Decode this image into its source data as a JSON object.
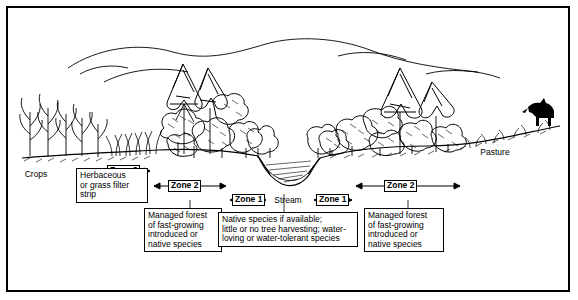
{
  "diagram": {
    "type": "cross-section illustration",
    "background_color": "#ffffff",
    "line_color": "#000000",
    "border": "rectangular black frame"
  },
  "landscape_labels": {
    "crops": "Crops",
    "pasture": "Pasture",
    "stream": "Stream"
  },
  "zone_markers": [
    {
      "id": "zone3",
      "label": "Zone 3",
      "side": "left"
    },
    {
      "id": "zone2_left",
      "label": "Zone 2",
      "side": "left"
    },
    {
      "id": "zone1_left",
      "label": "Zone 1",
      "side": "left"
    },
    {
      "id": "zone1_right",
      "label": "Zone 1",
      "side": "right"
    },
    {
      "id": "zone2_right",
      "label": "Zone 2",
      "side": "right"
    }
  ],
  "callouts": [
    {
      "id": "zone3-desc",
      "text": "Herbaceous or grass filter strip",
      "lines": [
        "Herbaceous",
        "or grass filter",
        "strip"
      ]
    },
    {
      "id": "zone2-left-desc",
      "text": "Managed forest of fast-growing introduced or native species",
      "lines": [
        "Managed forest",
        "of fast-growing",
        "introduced or",
        "native species"
      ]
    },
    {
      "id": "zone1-desc",
      "text": "Native species if available; little or no tree harvesting; water-loving or water-tolerant species",
      "lines": [
        "Native species if available;",
        "little or no tree harvesting; water-",
        "loving or water-tolerant species"
      ]
    },
    {
      "id": "zone2-right-desc",
      "text": "Managed forest of fast-growing introduced or native species",
      "lines": [
        "Managed forest",
        "of fast-growing",
        "introduced or",
        "native species"
      ]
    }
  ]
}
